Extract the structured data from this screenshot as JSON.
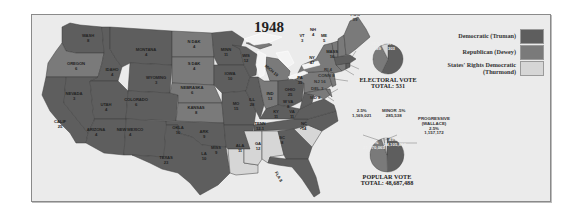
{
  "title": "1948",
  "colors": {
    "democratic": "#5e5e5e",
    "republican": "#7a7a7a",
    "states_rights": "#d6d6d6",
    "background": "#ebebeb",
    "water": "#ebebeb"
  },
  "legend": [
    {
      "label": "Democratic (Truman)",
      "color": "#5e5e5e"
    },
    {
      "label": "Republican (Dewey)",
      "color": "#7a7a7a"
    },
    {
      "label_line1": "States' Rights Democratic",
      "label_line2": "(Thurmond)",
      "color": "#d6d6d6"
    }
  ],
  "states": [
    {
      "name": "WASH",
      "votes": "8",
      "party": "D"
    },
    {
      "name": "OREGON",
      "votes": "6",
      "party": "R"
    },
    {
      "name": "CALIF",
      "votes": "25",
      "party": "D"
    },
    {
      "name": "IDAHO",
      "votes": "4",
      "party": "D"
    },
    {
      "name": "NEVADA",
      "votes": "3",
      "party": "D"
    },
    {
      "name": "MONTANA",
      "votes": "4",
      "party": "D"
    },
    {
      "name": "WYOMING",
      "votes": "3",
      "party": "D"
    },
    {
      "name": "UTAH",
      "votes": "4",
      "party": "D"
    },
    {
      "name": "COLORADO",
      "votes": "6",
      "party": "D"
    },
    {
      "name": "ARIZONA",
      "votes": "4",
      "party": "D"
    },
    {
      "name": "NEW MEXICO",
      "votes": "4",
      "party": "D"
    },
    {
      "name": "N DAK",
      "votes": "4",
      "party": "R"
    },
    {
      "name": "S DAK",
      "votes": "4",
      "party": "R"
    },
    {
      "name": "NEBRASKA",
      "votes": "6",
      "party": "R"
    },
    {
      "name": "KANSAS",
      "votes": "8",
      "party": "R"
    },
    {
      "name": "OKLA",
      "votes": "10",
      "party": "D"
    },
    {
      "name": "TEXAS",
      "votes": "23",
      "party": "D"
    },
    {
      "name": "MINN",
      "votes": "11",
      "party": "D"
    },
    {
      "name": "IOWA",
      "votes": "10",
      "party": "D"
    },
    {
      "name": "MO",
      "votes": "15",
      "party": "D"
    },
    {
      "name": "ARK",
      "votes": "9",
      "party": "D"
    },
    {
      "name": "LA",
      "votes": "10",
      "party": "SR"
    },
    {
      "name": "WIS",
      "votes": "12",
      "party": "D"
    },
    {
      "name": "ILL",
      "votes": "28",
      "party": "D"
    },
    {
      "name": "MICH",
      "votes": "19",
      "party": "R"
    },
    {
      "name": "IND",
      "votes": "13",
      "party": "R"
    },
    {
      "name": "OHIO",
      "votes": "25",
      "party": "D"
    },
    {
      "name": "KY",
      "votes": "11",
      "party": "D"
    },
    {
      "name": "TENN",
      "votes": "11",
      "votes_label": "12-1",
      "party": "D"
    },
    {
      "name": "MISS",
      "votes": "9",
      "party": "SR"
    },
    {
      "name": "ALA",
      "votes": "11",
      "party": "SR"
    },
    {
      "name": "GA",
      "votes": "12",
      "party": "D"
    },
    {
      "name": "FLA",
      "votes": "8",
      "party": "D"
    },
    {
      "name": "SC",
      "votes": "8",
      "party": "SR"
    },
    {
      "name": "NC",
      "votes": "14",
      "party": "D"
    },
    {
      "name": "VA",
      "votes": "11",
      "party": "D"
    },
    {
      "name": "W VA",
      "votes": "8",
      "party": "D"
    },
    {
      "name": "PA",
      "votes": "35",
      "party": "R"
    },
    {
      "name": "NY",
      "votes": "47",
      "party": "R"
    },
    {
      "name": "VT",
      "votes": "3",
      "party": "R"
    },
    {
      "name": "NH",
      "votes": "4",
      "party": "R"
    },
    {
      "name": "ME",
      "votes": "5",
      "party": "R"
    },
    {
      "name": "MASS",
      "votes": "16",
      "party": "D"
    },
    {
      "name": "RI",
      "votes": "4",
      "party": "D"
    },
    {
      "name": "CONN",
      "votes": "8",
      "party": "R"
    },
    {
      "name": "NJ",
      "votes": "16",
      "party": "R"
    },
    {
      "name": "DEL",
      "votes": "3",
      "party": "R"
    },
    {
      "name": "MD",
      "votes": "8",
      "party": "R"
    }
  ],
  "labels": {
    "WASH": "WASH",
    "WASH_v": "8",
    "OREGON": "OREGON",
    "OREGON_v": "6",
    "CALIF": "CALIF",
    "CALIF_v": "25",
    "IDAHO": "IDAHO",
    "IDAHO_v": "4",
    "NEVADA": "NEVADA",
    "NEVADA_v": "3",
    "MONTANA": "MONTANA",
    "MONTANA_v": "4",
    "WYOMING": "WYOMING",
    "WYOMING_v": "3",
    "UTAH": "UTAH",
    "UTAH_v": "4",
    "COLORADO": "COLORADO",
    "COLORADO_v": "6",
    "ARIZONA": "ARIZONA",
    "ARIZONA_v": "4",
    "NEWMEXICO": "NEW MEXICO",
    "NEWMEXICO_v": "4",
    "NDAK": "N DAK",
    "NDAK_v": "4",
    "SDAK": "S DAK",
    "SDAK_v": "4",
    "NEBRASKA": "NEBRASKA",
    "NEBRASKA_v": "6",
    "KANSAS": "KANSAS",
    "KANSAS_v": "8",
    "OKLA": "OKLA",
    "OKLA_v": "10",
    "TEXAS": "TEXAS",
    "TEXAS_v": "23",
    "MINN": "MINN",
    "MINN_v": "11",
    "IOWA": "IOWA",
    "IOWA_v": "10",
    "MO": "MO",
    "MO_v": "15",
    "ARK": "ARK",
    "ARK_v": "9",
    "LA": "LA",
    "LA_v": "10",
    "WIS": "WIS",
    "WIS_v": "12",
    "ILL": "ILL",
    "ILL_v": "28",
    "MICH": "MICH 19",
    "IND": "IND",
    "IND_v": "13",
    "OHIO": "OHIO",
    "OHIO_v": "25",
    "KY": "KY",
    "KY_v": "11",
    "TENN": "TENN",
    "TENN_v": "12-1",
    "MISS": "MISS",
    "MISS_v": "9",
    "ALA": "ALA",
    "ALA_v": "11",
    "GA": "GA",
    "GA_v": "12",
    "FLA": "FLA 8",
    "SC": "SC",
    "SC_v": "8",
    "NC": "NC",
    "NC_v": "14",
    "VA": "VA",
    "VA_v": "11",
    "WVA": "W VA",
    "WVA_v": "8",
    "PA": "PA",
    "PA_v": "35",
    "NY": "NY",
    "NY_v": "47",
    "VT": "VT",
    "VT_v": "3",
    "NH": "NH",
    "NH_v": "4",
    "ME": "ME",
    "ME_v": "5",
    "MASS": "MASS",
    "MASS_v": "16",
    "RI": "RI 4",
    "CONN": "CONN 8",
    "NJ": "NJ 16",
    "DEL": "DEL 3",
    "MD": "MD 8"
  },
  "electoral_vote": {
    "title": "ELECTORAL VOTE",
    "total_label": "TOTAL: 531",
    "total": 531,
    "slices": [
      {
        "party": "Democratic (Truman)",
        "percent": "57%",
        "votes": "303"
      },
      {
        "party": "Republican (Dewey)",
        "percent": "35.5%",
        "votes": "189"
      },
      {
        "party": "States' Rights Democratic (Thurmond)",
        "percent": "7.5%",
        "votes": "39"
      }
    ]
  },
  "popular_vote": {
    "title": "POPULAR VOTE",
    "total_label": "TOTAL: 48,687,488",
    "total": 48687488,
    "slices": [
      {
        "party": "Democratic (Truman)",
        "percent": "49.5%",
        "votes": "24,105,812"
      },
      {
        "party": "Republican (Dewey)",
        "percent": "45%",
        "votes": "21,970,065"
      },
      {
        "party": "States' Rights Democratic (Thurmond)",
        "percent": "2.5%",
        "votes": "1,169,021"
      },
      {
        "party": "Progressive (Wallace)",
        "percent": "2.5%",
        "votes": "1,157,172"
      },
      {
        "party": "Minor",
        "percent": ".5%",
        "votes": "285,538"
      }
    ],
    "annotations": {
      "thurmond_line1": "2.5%",
      "thurmond_line2": "1,169,021",
      "minor_line1": "MINOR .5%",
      "minor_line2": "285,538",
      "progressive_line1": "PROGRESSIVE",
      "progressive_line2": "(WALLACE)",
      "progressive_line3": "2.5%",
      "progressive_line4": "1,157,172",
      "dem_line1": "49.5%",
      "dem_line2": "24,105,812",
      "rep_line1": "45%",
      "rep_line2": "21,970,065"
    }
  },
  "electoral_annotations": {
    "sr_line1": "7.5%",
    "sr_line2": "39",
    "rep_line1": "35.5%",
    "rep_line2": "189",
    "dem_line1": "57%",
    "dem_line2": "303"
  }
}
